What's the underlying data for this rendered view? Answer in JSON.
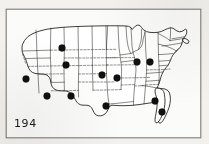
{
  "figure": {
    "number_label": "194",
    "caption": "",
    "frame": {
      "x": 6,
      "y": 9,
      "width": 195,
      "height": 129
    }
  },
  "colors": {
    "page_background": "#f2f1ee",
    "frame_fill": "#fbfbfa",
    "frame_stroke": "#7d7b76",
    "coastline": "#1d1c1a",
    "state_border": "#2b2a27",
    "marker_fill": "#111110",
    "figure_number": "#1a1a18"
  },
  "chart_data": {
    "type": "scatter",
    "title": "194",
    "xlabel": "",
    "ylabel": "",
    "basemap": "contiguous-united-states",
    "marker_shape": "filled-circle",
    "marker_radius_px": 3.4,
    "count": 12,
    "xlim": [
      6,
      201
    ],
    "ylim": [
      9,
      138
    ],
    "grid": false,
    "legend": null,
    "points": [
      {
        "label": "marker-1",
        "region": "northern-rockies",
        "x": 62,
        "y": 48
      },
      {
        "label": "marker-2",
        "region": "great-basin-north",
        "x": 66,
        "y": 65
      },
      {
        "label": "marker-3",
        "region": "pacific-southwest",
        "x": 26,
        "y": 79
      },
      {
        "label": "marker-4",
        "region": "desert-southwest",
        "x": 47,
        "y": 96
      },
      {
        "label": "marker-5",
        "region": "southwest-interior",
        "x": 71,
        "y": 96
      },
      {
        "label": "marker-6",
        "region": "central-plains",
        "x": 102,
        "y": 75
      },
      {
        "label": "marker-7",
        "region": "lower-midwest",
        "x": 117,
        "y": 78
      },
      {
        "label": "marker-8",
        "region": "south-central",
        "x": 106,
        "y": 106
      },
      {
        "label": "marker-9",
        "region": "upper-great-lakes",
        "x": 137,
        "y": 62
      },
      {
        "label": "marker-10",
        "region": "eastern-great-lakes",
        "x": 150,
        "y": 62
      },
      {
        "label": "marker-11",
        "region": "southeast-inland",
        "x": 155,
        "y": 101
      },
      {
        "label": "marker-12",
        "region": "southeast-coastal",
        "x": 162,
        "y": 112
      }
    ]
  }
}
